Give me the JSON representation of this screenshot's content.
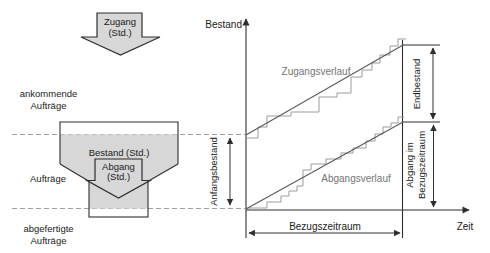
{
  "colors": {
    "fill_gray": "#d7d7d7",
    "line_dark": "#2e2e2e",
    "line_mid": "#5a5a5a",
    "line_steps": "#9b9b9b",
    "line_dashed": "#a0a0a0",
    "text": "#1b1b1b",
    "text_gray": "#757575"
  },
  "funnel": {
    "input_arrow": {
      "line1": "Zugang",
      "line2": "(Std.)"
    },
    "incoming": {
      "line1": "ankommende",
      "line2": "Aufträge"
    },
    "stock_label": "Bestand (Std.)",
    "output_arrow": {
      "line1": "Abgang",
      "line2": "(Std.)"
    },
    "orders_label": "Aufträge",
    "finished": {
      "line1": "abgefertigte",
      "line2": "Aufträge"
    }
  },
  "chart": {
    "y_axis_label": "Bestand",
    "x_axis_label": "Zeit",
    "input_curve_label": "Zugangsverlauf",
    "output_curve_label": "Abgangsverlauf",
    "initial_stock_label": "Anfangsbestand",
    "end_stock_label": "Endbestand",
    "output_in_period": {
      "line1": "Abgang im",
      "line2": "Bezugszeitraum"
    },
    "period_label": "Bezugszeitraum",
    "curves": {
      "zugang_diagonal": [
        [
          246,
          135
        ],
        [
          403,
          45
        ]
      ],
      "abgang_diagonal": [
        [
          246,
          209
        ],
        [
          403,
          122
        ]
      ],
      "zugang_steps": [
        [
          246,
          138
        ],
        [
          258,
          138
        ],
        [
          258,
          127
        ],
        [
          267,
          127
        ],
        [
          267,
          116
        ],
        [
          291,
          116
        ],
        [
          291,
          112
        ],
        [
          319,
          112
        ],
        [
          319,
          97
        ],
        [
          337,
          97
        ],
        [
          337,
          93
        ],
        [
          351,
          93
        ],
        [
          351,
          77
        ],
        [
          362,
          77
        ],
        [
          362,
          70
        ],
        [
          372,
          70
        ],
        [
          372,
          63
        ],
        [
          380,
          63
        ],
        [
          380,
          55
        ],
        [
          390,
          55
        ],
        [
          390,
          46
        ],
        [
          398,
          46
        ],
        [
          398,
          39
        ],
        [
          406,
          39
        ]
      ],
      "abgang_steps": [
        [
          246,
          208
        ],
        [
          267,
          208
        ],
        [
          267,
          202
        ],
        [
          281,
          202
        ],
        [
          281,
          196
        ],
        [
          289,
          196
        ],
        [
          289,
          191
        ],
        [
          297,
          191
        ],
        [
          297,
          186
        ],
        [
          303,
          186
        ],
        [
          303,
          170
        ],
        [
          311,
          170
        ],
        [
          311,
          164
        ],
        [
          326,
          164
        ],
        [
          326,
          159
        ],
        [
          341,
          159
        ],
        [
          341,
          153
        ],
        [
          353,
          153
        ],
        [
          353,
          148
        ],
        [
          366,
          148
        ],
        [
          366,
          141
        ],
        [
          375,
          141
        ],
        [
          375,
          134
        ],
        [
          383,
          134
        ],
        [
          383,
          127
        ],
        [
          391,
          127
        ],
        [
          391,
          123
        ],
        [
          398,
          123
        ],
        [
          398,
          117
        ],
        [
          404,
          117
        ]
      ]
    }
  }
}
